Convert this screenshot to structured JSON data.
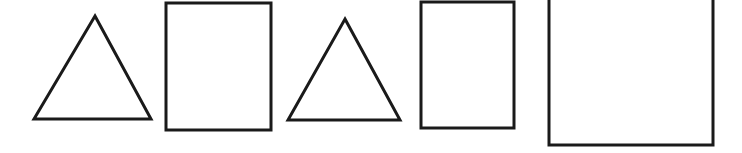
{
  "canvas": {
    "width": 742,
    "height": 153,
    "background_color": "#ffffff",
    "stroke_color": "#1a1a1a",
    "fill_color": "none",
    "description": "Row of five outlined geometric shapes on a white background"
  },
  "shapes": [
    {
      "index": 1,
      "name": "triangle-1",
      "kind": "triangle",
      "stroke_color": "#1a1a1a",
      "stroke_width": 3,
      "fill": "none",
      "points": [
        [
          95,
          16
        ],
        [
          151,
          119
        ],
        [
          34,
          119
        ]
      ],
      "bbox": {
        "x": 34,
        "y": 16,
        "width": 117,
        "height": 103
      }
    },
    {
      "index": 2,
      "name": "rectangle-1",
      "kind": "rectangle",
      "stroke_color": "#1a1a1a",
      "stroke_width": 3,
      "fill": "none",
      "bbox": {
        "x": 166,
        "y": 3,
        "width": 105,
        "height": 127
      }
    },
    {
      "index": 3,
      "name": "triangle-2",
      "kind": "triangle",
      "stroke_color": "#1a1a1a",
      "stroke_width": 3,
      "fill": "none",
      "points": [
        [
          345,
          19
        ],
        [
          400,
          120
        ],
        [
          288,
          120
        ]
      ],
      "bbox": {
        "x": 288,
        "y": 19,
        "width": 112,
        "height": 101
      }
    },
    {
      "index": 4,
      "name": "rectangle-2",
      "kind": "rectangle",
      "stroke_color": "#1a1a1a",
      "stroke_width": 3,
      "fill": "none",
      "bbox": {
        "x": 421,
        "y": 2,
        "width": 93,
        "height": 126
      }
    },
    {
      "index": 5,
      "name": "rectangle-3",
      "kind": "rectangle",
      "stroke_color": "#1a1a1a",
      "stroke_width": 3,
      "fill": "none",
      "top_edge_cropped": true,
      "bbox": {
        "x": 549,
        "y": -5,
        "width": 164,
        "height": 150
      }
    }
  ]
}
